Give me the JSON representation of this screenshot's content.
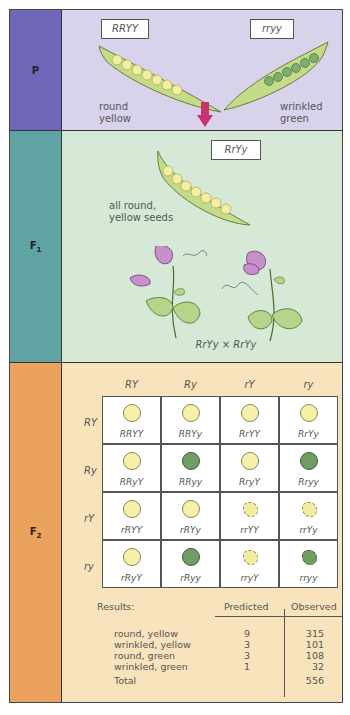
{
  "p_generation": {
    "label": "P",
    "parent1": {
      "genotype": "RRYY",
      "phenotype_line1": "round",
      "phenotype_line2": "yellow"
    },
    "parent2": {
      "genotype": "rryy",
      "phenotype_line1": "wrinkled",
      "phenotype_line2": "green"
    },
    "arrow_color": "#c8336e"
  },
  "f1_generation": {
    "label": "F",
    "label_sub": "1",
    "genotype": "RrYy",
    "description_line1": "all round,",
    "description_line2": "yellow seeds",
    "cross": "RrYy × RrYy"
  },
  "f2_generation": {
    "label": "F",
    "label_sub": "2",
    "column_gametes": [
      "RY",
      "Ry",
      "rY",
      "ry"
    ],
    "row_gametes": [
      "RY",
      "Ry",
      "rY",
      "ry"
    ],
    "cells": [
      [
        {
          "genotype": "RRYY",
          "seed": "yellow"
        },
        {
          "genotype": "RRYy",
          "seed": "yellow"
        },
        {
          "genotype": "RrYY",
          "seed": "yellow"
        },
        {
          "genotype": "RrYy",
          "seed": "yellow"
        }
      ],
      [
        {
          "genotype": "RRyY",
          "seed": "yellow"
        },
        {
          "genotype": "RRyy",
          "seed": "green"
        },
        {
          "genotype": "RryY",
          "seed": "yellow"
        },
        {
          "genotype": "Rryy",
          "seed": "green"
        }
      ],
      [
        {
          "genotype": "rRYY",
          "seed": "yellow"
        },
        {
          "genotype": "rRYy",
          "seed": "yellow"
        },
        {
          "genotype": "rrYY",
          "seed": "wrinkled-yellow"
        },
        {
          "genotype": "rrYy",
          "seed": "wrinkled-yellow"
        }
      ],
      [
        {
          "genotype": "rRyY",
          "seed": "yellow"
        },
        {
          "genotype": "rRyy",
          "seed": "green"
        },
        {
          "genotype": "rryY",
          "seed": "wrinkled-yellow"
        },
        {
          "genotype": "rryy",
          "seed": "wrinkled-green"
        }
      ]
    ],
    "results": {
      "title": "Results:",
      "predicted_header": "Predicted",
      "observed_header": "Observed",
      "rows": [
        {
          "phenotype": "round, yellow",
          "predicted": "9",
          "observed": "315"
        },
        {
          "phenotype": "wrinkled, yellow",
          "predicted": "3",
          "observed": "101"
        },
        {
          "phenotype": "round, green",
          "predicted": "3",
          "observed": "108"
        },
        {
          "phenotype": "wrinkled, green",
          "predicted": "1",
          "observed": "32"
        }
      ],
      "total_label": "Total",
      "total_observed": "556"
    }
  },
  "colors": {
    "p_label_bg": "#6f67b8",
    "p_content_bg": "#d8d2ea",
    "f1_label_bg": "#5fa4a2",
    "f1_content_bg": "#d6e8d6",
    "f2_label_bg": "#eba25c",
    "f2_content_bg": "#f9e3bd",
    "seed_yellow": "#f6f0a8",
    "seed_green": "#6f9e64",
    "pod_green": "#c4dc8a"
  }
}
